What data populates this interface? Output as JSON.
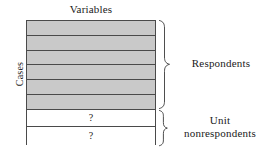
{
  "figure": {
    "top_axis_title": "Variables",
    "left_axis_title": "Cases",
    "matrix": {
      "filled_rows": [
        {
          "mark": ""
        },
        {
          "mark": ""
        },
        {
          "mark": ""
        },
        {
          "mark": ""
        },
        {
          "mark": ""
        },
        {
          "mark": ""
        }
      ],
      "empty_rows": [
        {
          "mark": "?"
        },
        {
          "mark": "?"
        }
      ],
      "fill_color": "#c9c9c9",
      "empty_color": "#ffffff",
      "border_color": "#4a4a4a"
    },
    "groups": [
      {
        "id": "respondents",
        "label": "Respondents",
        "label_lines": [
          "Respondents"
        ]
      },
      {
        "id": "unit-nonrespondents",
        "label": "Unit nonrespondents",
        "label_lines": [
          "Unit",
          "nonrespondents"
        ]
      }
    ]
  }
}
